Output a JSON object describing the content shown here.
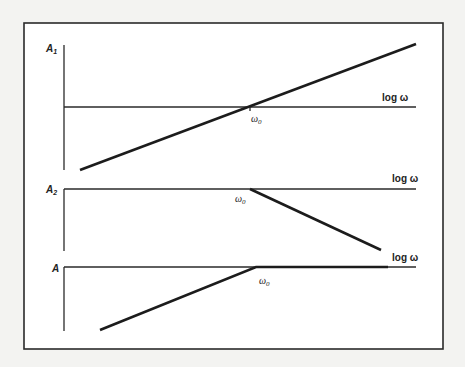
{
  "figure": {
    "panels": [
      {
        "id": "A1",
        "ylabel": "A",
        "ylabel_sub": "1",
        "xlabel": "log ω",
        "break_label": "ω",
        "break_sub": "0",
        "shape": "rising line crossing axis at ω0"
      },
      {
        "id": "A2",
        "ylabel": "A",
        "ylabel_sub": "2",
        "xlabel": "log ω",
        "break_label": "ω",
        "break_sub": "0",
        "shape": "flat until ω0, then falling line"
      },
      {
        "id": "A",
        "ylabel": "A",
        "ylabel_sub": "",
        "xlabel": "log ω",
        "break_label": "ω",
        "break_sub": "0",
        "shape": "rising line up to ω0, then flat"
      }
    ]
  }
}
